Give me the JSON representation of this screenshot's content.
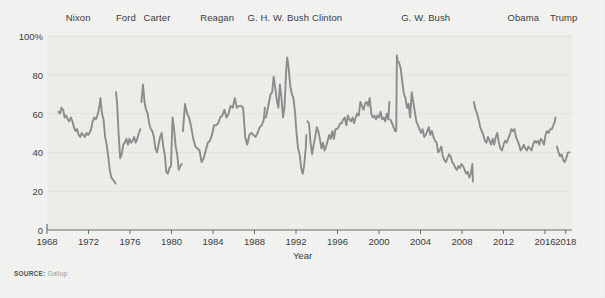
{
  "source": {
    "prefix": "SOURCE:",
    "name": "Gallup"
  },
  "axes": {
    "x_title": "Year",
    "y_ticks": [
      "0",
      "20",
      "40",
      "60",
      "80",
      "100%"
    ],
    "x_ticks": [
      "1968",
      "1972",
      "1976",
      "1980",
      "1984",
      "1988",
      "1992",
      "1996",
      "2000",
      "2004",
      "2008",
      "2012",
      "2016",
      "2018"
    ]
  },
  "colors": {
    "line": "#8c8c8c",
    "plot_background": "#ededea",
    "figure_background": "#f2f2f0",
    "axis": "#6b6b6b",
    "gridline": "#e2e2de",
    "text": "#3b3b3b"
  },
  "presidents": [
    {
      "label": "Nixon",
      "center_year": 1971.0
    },
    {
      "label": "Ford",
      "center_year": 1975.6
    },
    {
      "label": "Carter",
      "center_year": 1978.6
    },
    {
      "label": "Reagan",
      "center_year": 1984.4
    },
    {
      "label": "G. H. W. Bush",
      "center_year": 1990.3
    },
    {
      "label": "Clinton",
      "center_year": 1995.0
    },
    {
      "label": "G. W. Bush",
      "center_year": 2004.5
    },
    {
      "label": "Obama",
      "center_year": 2013.9
    },
    {
      "label": "Trump",
      "center_year": 2017.8
    }
  ],
  "chart_data": {
    "type": "line",
    "title": "",
    "subtitle": "",
    "xlabel": "Year",
    "ylabel": "",
    "xlim": [
      1968,
      2018.6
    ],
    "ylim": [
      0,
      100
    ],
    "grid": true,
    "legend": false,
    "y_tick_values": [
      0,
      20,
      40,
      60,
      80,
      100
    ],
    "x_tick_values": [
      1968,
      1972,
      1976,
      1980,
      1984,
      1988,
      1992,
      1996,
      2000,
      2004,
      2008,
      2012,
      2016,
      2018
    ],
    "units": "percent approving",
    "annotations": [
      {
        "text": "Nixon",
        "type": "era-label",
        "x": 1971.0
      },
      {
        "text": "Ford",
        "type": "era-label",
        "x": 1975.6
      },
      {
        "text": "Carter",
        "type": "era-label",
        "x": 1978.6
      },
      {
        "text": "Reagan",
        "type": "era-label",
        "x": 1984.4
      },
      {
        "text": "G. H. W. Bush",
        "type": "era-label",
        "x": 1990.3
      },
      {
        "text": "Clinton",
        "type": "era-label",
        "x": 1995.0
      },
      {
        "text": "G. W. Bush",
        "type": "era-label",
        "x": 2004.5
      },
      {
        "text": "Obama",
        "type": "era-label",
        "x": 2013.9
      },
      {
        "text": "Trump",
        "type": "era-label",
        "x": 2017.8
      }
    ],
    "series": [
      {
        "name": "Nixon",
        "x": [
          1969.1,
          1969.25,
          1969.4,
          1969.55,
          1969.7,
          1969.85,
          1970.0,
          1970.15,
          1970.3,
          1970.45,
          1970.6,
          1970.75,
          1970.9,
          1971.05,
          1971.2,
          1971.35,
          1971.5,
          1971.65,
          1971.8,
          1971.95,
          1972.1,
          1972.25,
          1972.4,
          1972.55,
          1972.7,
          1972.85,
          1973.0,
          1973.15,
          1973.3,
          1973.45,
          1973.6,
          1973.75,
          1973.9,
          1974.05,
          1974.2,
          1974.35,
          1974.5,
          1974.6
        ],
        "values": [
          61,
          60,
          63,
          62,
          58,
          59,
          57,
          56,
          58,
          56,
          53,
          51,
          52,
          49,
          48,
          50,
          49,
          48,
          50,
          49,
          50,
          52,
          56,
          58,
          57,
          59,
          62,
          68,
          60,
          57,
          48,
          44,
          38,
          31,
          27,
          26,
          25,
          24
        ]
      },
      {
        "name": "Ford",
        "x": [
          1974.65,
          1974.75,
          1974.9,
          1975.05,
          1975.2,
          1975.35,
          1975.5,
          1975.65,
          1975.8,
          1975.95,
          1976.1,
          1976.25,
          1976.4,
          1976.55,
          1976.7,
          1976.85,
          1977.0
        ],
        "values": [
          71,
          66,
          50,
          37,
          39,
          44,
          45,
          47,
          44,
          47,
          45,
          46,
          48,
          45,
          47,
          50,
          52
        ]
      },
      {
        "name": "Carter",
        "x": [
          1977.1,
          1977.25,
          1977.4,
          1977.55,
          1977.7,
          1977.85,
          1978.0,
          1978.15,
          1978.3,
          1978.45,
          1978.6,
          1978.75,
          1978.9,
          1979.05,
          1979.2,
          1979.35,
          1979.5,
          1979.65,
          1979.8,
          1979.95,
          1980.1,
          1980.25,
          1980.4,
          1980.55,
          1980.7,
          1980.85,
          1981.0
        ],
        "values": [
          66,
          75,
          66,
          62,
          60,
          55,
          52,
          51,
          48,
          42,
          40,
          44,
          48,
          50,
          43,
          39,
          30,
          29,
          32,
          33,
          58,
          52,
          43,
          39,
          31,
          33,
          34
        ]
      },
      {
        "name": "Reagan",
        "x": [
          1981.1,
          1981.3,
          1981.5,
          1981.7,
          1981.9,
          1982.1,
          1982.3,
          1982.5,
          1982.7,
          1982.9,
          1983.1,
          1983.3,
          1983.5,
          1983.7,
          1983.9,
          1984.1,
          1984.3,
          1984.5,
          1984.7,
          1984.9,
          1985.1,
          1985.3,
          1985.5,
          1985.7,
          1985.9,
          1986.1,
          1986.3,
          1986.5,
          1986.7,
          1986.9,
          1987.1,
          1987.3,
          1987.5,
          1987.7,
          1987.9,
          1988.1,
          1988.3,
          1988.5,
          1988.7,
          1988.9,
          1989.0
        ],
        "values": [
          51,
          65,
          60,
          58,
          53,
          47,
          43,
          42,
          41,
          35,
          37,
          41,
          45,
          46,
          49,
          54,
          54,
          55,
          58,
          59,
          62,
          58,
          60,
          64,
          63,
          68,
          63,
          64,
          64,
          63,
          48,
          44,
          49,
          50,
          49,
          48,
          50,
          53,
          54,
          57,
          63
        ]
      },
      {
        "name": "G. H. W. Bush",
        "x": [
          1989.1,
          1989.25,
          1989.4,
          1989.55,
          1989.7,
          1989.85,
          1990.0,
          1990.15,
          1990.3,
          1990.45,
          1990.6,
          1990.75,
          1990.9,
          1991.05,
          1991.15,
          1991.3,
          1991.45,
          1991.6,
          1991.75,
          1991.9,
          1992.05,
          1992.2,
          1992.35,
          1992.5,
          1992.65,
          1992.8,
          1992.95,
          1993.0
        ],
        "values": [
          58,
          62,
          66,
          70,
          71,
          79,
          73,
          67,
          63,
          75,
          68,
          58,
          64,
          82,
          89,
          83,
          74,
          70,
          68,
          61,
          50,
          42,
          39,
          32,
          29,
          34,
          43,
          49
        ]
      },
      {
        "name": "Clinton",
        "x": [
          1993.1,
          1993.25,
          1993.4,
          1993.55,
          1993.7,
          1993.85,
          1994.0,
          1994.15,
          1994.3,
          1994.45,
          1994.6,
          1994.75,
          1994.9,
          1995.05,
          1995.2,
          1995.35,
          1995.5,
          1995.65,
          1995.8,
          1995.95,
          1996.1,
          1996.25,
          1996.4,
          1996.55,
          1996.7,
          1996.85,
          1997.0,
          1997.15,
          1997.3,
          1997.45,
          1997.6,
          1997.75,
          1997.9,
          1998.05,
          1998.2,
          1998.35,
          1998.5,
          1998.65,
          1998.8,
          1998.95,
          1999.1,
          1999.25,
          1999.4,
          1999.55,
          1999.7,
          1999.85,
          2000.0,
          2000.15,
          2000.3,
          2000.45,
          2000.6,
          2000.75,
          2000.9,
          2001.0
        ],
        "values": [
          56,
          55,
          45,
          39,
          44,
          48,
          53,
          51,
          47,
          42,
          45,
          41,
          43,
          46,
          49,
          47,
          51,
          47,
          52,
          52,
          53,
          55,
          55,
          57,
          58,
          54,
          59,
          57,
          56,
          58,
          55,
          58,
          60,
          59,
          66,
          64,
          62,
          65,
          66,
          64,
          68,
          60,
          58,
          59,
          57,
          59,
          58,
          61,
          57,
          58,
          56,
          60,
          57,
          66
        ]
      },
      {
        "name": "G. W. Bush",
        "x": [
          2001.1,
          2001.25,
          2001.4,
          2001.55,
          2001.66,
          2001.72,
          2001.8,
          2001.95,
          2002.1,
          2002.25,
          2002.4,
          2002.55,
          2002.7,
          2002.85,
          2003.0,
          2003.15,
          2003.3,
          2003.45,
          2003.6,
          2003.75,
          2003.9,
          2004.05,
          2004.2,
          2004.35,
          2004.5,
          2004.65,
          2004.8,
          2004.95,
          2005.1,
          2005.25,
          2005.4,
          2005.55,
          2005.7,
          2005.85,
          2006.0,
          2006.15,
          2006.3,
          2006.45,
          2006.6,
          2006.75,
          2006.9,
          2007.05,
          2007.2,
          2007.35,
          2007.5,
          2007.65,
          2007.8,
          2007.95,
          2008.1,
          2008.25,
          2008.4,
          2008.55,
          2008.7,
          2008.85,
          2009.0,
          2009.05
        ],
        "values": [
          57,
          55,
          53,
          51,
          51,
          90,
          87,
          86,
          83,
          76,
          70,
          68,
          63,
          65,
          58,
          71,
          66,
          61,
          56,
          54,
          52,
          50,
          52,
          48,
          49,
          51,
          53,
          49,
          51,
          48,
          46,
          45,
          40,
          41,
          43,
          38,
          36,
          35,
          37,
          39,
          38,
          35,
          34,
          32,
          31,
          33,
          32,
          34,
          33,
          31,
          29,
          30,
          27,
          29,
          34,
          25
        ]
      },
      {
        "name": "Obama",
        "x": [
          2009.15,
          2009.3,
          2009.45,
          2009.6,
          2009.75,
          2009.9,
          2010.05,
          2010.2,
          2010.35,
          2010.5,
          2010.65,
          2010.8,
          2010.95,
          2011.1,
          2011.25,
          2011.4,
          2011.55,
          2011.7,
          2011.85,
          2012.0,
          2012.15,
          2012.3,
          2012.45,
          2012.6,
          2012.75,
          2012.9,
          2013.05,
          2013.2,
          2013.35,
          2013.5,
          2013.65,
          2013.8,
          2013.95,
          2014.1,
          2014.25,
          2014.4,
          2014.55,
          2014.7,
          2014.85,
          2015.0,
          2015.15,
          2015.3,
          2015.45,
          2015.6,
          2015.75,
          2015.9,
          2016.05,
          2016.2,
          2016.35,
          2016.5,
          2016.65,
          2016.8,
          2016.95,
          2017.0
        ],
        "values": [
          66,
          62,
          60,
          57,
          53,
          51,
          49,
          46,
          45,
          48,
          46,
          44,
          47,
          44,
          48,
          50,
          45,
          42,
          41,
          44,
          46,
          45,
          47,
          49,
          52,
          51,
          52,
          48,
          46,
          44,
          41,
          42,
          44,
          42,
          41,
          43,
          42,
          41,
          44,
          46,
          45,
          46,
          44,
          47,
          46,
          44,
          49,
          51,
          50,
          52,
          52,
          54,
          56,
          58
        ]
      },
      {
        "name": "Trump",
        "x": [
          2017.15,
          2017.3,
          2017.45,
          2017.6,
          2017.75,
          2017.9,
          2018.05,
          2018.2,
          2018.35
        ],
        "values": [
          43,
          40,
          38,
          39,
          36,
          35,
          37,
          40,
          40
        ]
      }
    ]
  }
}
